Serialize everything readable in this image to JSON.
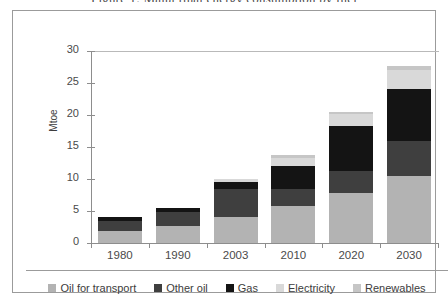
{
  "figure": {
    "title_clipped": "Figure 1: Malta final energy consumption by fuel",
    "frame_border_color": "#9b9b9b"
  },
  "chart_data": {
    "type": "bar",
    "stacked": true,
    "title": "Figure 1: Malta final energy consumption by fuel",
    "xlabel": "",
    "ylabel": "Mtoe",
    "ylim": [
      0,
      30
    ],
    "yticks": [
      0,
      5,
      10,
      15,
      20,
      25,
      30
    ],
    "grid": false,
    "legend_position": "bottom",
    "categories": [
      "1980",
      "1990",
      "2003",
      "2010",
      "2020",
      "2030"
    ],
    "series": [
      {
        "name": "Oil for transport",
        "color": "#b3b3b3",
        "values": [
          1.8,
          2.7,
          4.0,
          5.8,
          7.8,
          10.5
        ]
      },
      {
        "name": "Other oil",
        "color": "#3f3f3f",
        "values": [
          1.6,
          2.2,
          4.5,
          2.7,
          3.5,
          5.5
        ]
      },
      {
        "name": "Gas",
        "color": "#141414",
        "values": [
          0.6,
          0.6,
          1.0,
          3.6,
          7.0,
          8.0
        ]
      },
      {
        "name": "Electricity",
        "color": "#d9d9d9",
        "values": [
          0.0,
          0.0,
          0.5,
          1.2,
          1.8,
          3.0
        ]
      },
      {
        "name": "Renewables",
        "color": "#c6c6c6",
        "values": [
          0.0,
          0.0,
          0.0,
          0.5,
          0.4,
          0.7
        ]
      }
    ],
    "totals": [
      4.0,
      5.5,
      10.0,
      13.8,
      20.5,
      27.7
    ]
  }
}
